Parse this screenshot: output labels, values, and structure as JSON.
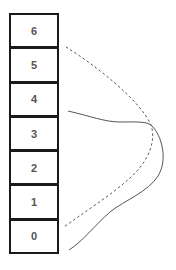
{
  "diagram": {
    "cells": [
      {
        "label": "6"
      },
      {
        "label": "5"
      },
      {
        "label": "4"
      },
      {
        "label": "3"
      },
      {
        "label": "2"
      },
      {
        "label": "1"
      },
      {
        "label": "0"
      }
    ],
    "curves": [
      {
        "name": "dashed-curve",
        "style": "dashed",
        "color": "#555555"
      },
      {
        "name": "solid-curve",
        "style": "solid",
        "color": "#555555"
      }
    ]
  }
}
